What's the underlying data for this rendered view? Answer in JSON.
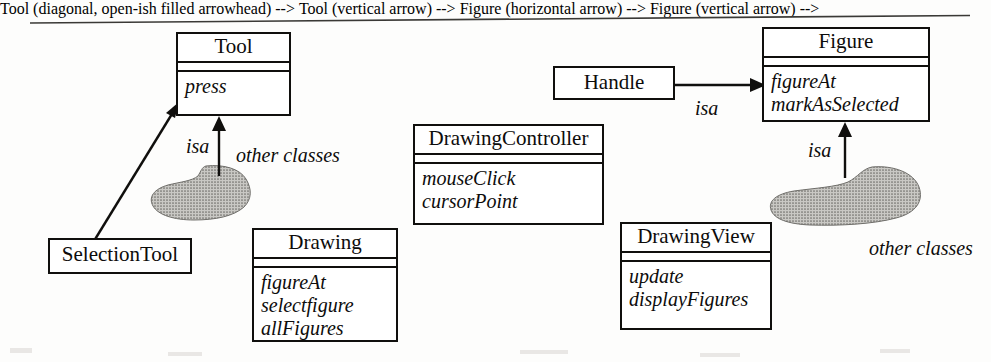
{
  "diagram": {
    "kind": "uml-class-diagram",
    "ink_color": "#100f0d",
    "blob_fill": "#9b9b97",
    "classes": [
      {
        "id": "tool",
        "name": "Tool",
        "operations": [
          "press"
        ],
        "x": 176,
        "y": 32,
        "w": 115,
        "h": 84
      },
      {
        "id": "selection-tool",
        "name": "SelectionTool",
        "operations": [],
        "x": 48,
        "y": 238,
        "w": 144,
        "h": 36
      },
      {
        "id": "drawing",
        "name": "Drawing",
        "operations": [
          "figureAt",
          "selectfigure",
          "allFigures"
        ],
        "x": 252,
        "y": 228,
        "w": 146,
        "h": 114
      },
      {
        "id": "drawing-controller",
        "name": "DrawingController",
        "operations": [
          "mouseClick",
          "cursorPoint"
        ],
        "x": 413,
        "y": 124,
        "w": 191,
        "h": 101
      },
      {
        "id": "drawing-view",
        "name": "DrawingView",
        "operations": [
          "update",
          "displayFigures"
        ],
        "x": 620,
        "y": 222,
        "w": 152,
        "h": 108
      },
      {
        "id": "handle",
        "name": "Handle",
        "operations": [],
        "x": 553,
        "y": 66,
        "w": 122,
        "h": 34
      },
      {
        "id": "figure",
        "name": "Figure",
        "operations": [
          "figureAt",
          "markAsSelected"
        ],
        "x": 762,
        "y": 27,
        "w": 168,
        "h": 95
      }
    ],
    "relations": [
      {
        "id": "selectiontool-isa-tool",
        "label": "",
        "from": "selection-tool",
        "to": "tool",
        "type": "isa-arrow",
        "direction": "diagonal-up-right"
      },
      {
        "id": "otherclasses-left-isa-tool",
        "label": "isa",
        "from": "other-classes-left",
        "to": "tool",
        "type": "isa-arrow",
        "direction": "up",
        "label_x": 186,
        "label_y": 136
      },
      {
        "id": "handle-isa-figure",
        "label": "isa",
        "from": "handle",
        "to": "figure",
        "type": "isa-arrow",
        "direction": "right",
        "label_x": 695,
        "label_y": 98
      },
      {
        "id": "otherclasses-right-isa-figure",
        "label": "isa",
        "from": "other-classes-right",
        "to": "figure",
        "type": "isa-arrow",
        "direction": "up",
        "label_x": 808,
        "label_y": 140
      }
    ],
    "blobs": [
      {
        "id": "other-classes-left",
        "label": "other classes",
        "label_x": 236,
        "label_y": 145,
        "x": 150,
        "y": 165,
        "w": 118,
        "h": 58
      },
      {
        "id": "other-classes-right",
        "label": "other classes",
        "label_x": 869,
        "label_y": 238,
        "x": 772,
        "y": 167,
        "w": 150,
        "h": 60
      }
    ]
  }
}
